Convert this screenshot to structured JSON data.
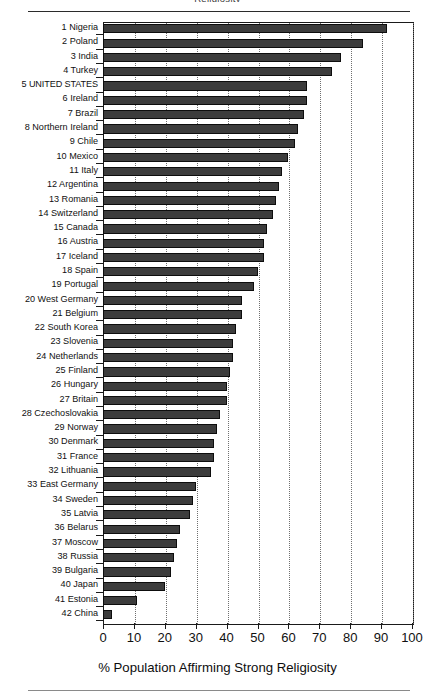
{
  "page": {
    "header_clipped_text": "Religiosity",
    "has_top_rule": true,
    "has_bottom_rule": true
  },
  "chart_data": {
    "type": "bar",
    "orientation": "horizontal",
    "title": "",
    "xlabel": "% Population Affirming Strong Religiosity",
    "ylabel": "",
    "xlim": [
      0,
      100
    ],
    "ylim": null,
    "grid": "vertical-dotted",
    "legend": "none",
    "xticks": [
      0,
      10,
      20,
      30,
      40,
      50,
      60,
      70,
      80,
      90,
      100
    ],
    "xticklabels": [
      "0",
      "10",
      "20",
      "30",
      "40",
      "50",
      "60",
      "70",
      "80",
      "90",
      "100"
    ],
    "bar_color": "#3c3c3c",
    "categories": [
      "1 Nigeria",
      "2 Poland",
      "3 India",
      "4 Turkey",
      "5 UNITED STATES",
      "6 Ireland",
      "7 Brazil",
      "8 Northern Ireland",
      "9 Chile",
      "10 Mexico",
      "11 Italy",
      "12 Argentina",
      "13 Romania",
      "14 Switzerland",
      "15 Canada",
      "16 Austria",
      "17 Iceland",
      "18 Spain",
      "19 Portugal",
      "20 West Germany",
      "21 Belgium",
      "22 South Korea",
      "23 Slovenia",
      "24 Netherlands",
      "25 Finland",
      "26 Hungary",
      "27 Britain",
      "28 Czechoslovakia",
      "29 Norway",
      "30 Denmark",
      "31 France",
      "32 Lithuania",
      "33 East Germany",
      "34 Sweden",
      "35 Latvia",
      "36 Belarus",
      "37 Moscow",
      "38 Russia",
      "39 Bulgaria",
      "40 Japan",
      "41 Estonia",
      "42 China"
    ],
    "values": [
      92,
      84,
      77,
      74,
      66,
      66,
      65,
      63,
      62,
      60,
      58,
      57,
      56,
      55,
      53,
      52,
      52,
      50,
      49,
      45,
      45,
      43,
      42,
      42,
      41,
      40,
      40,
      38,
      37,
      36,
      36,
      35,
      30,
      29,
      28,
      25,
      24,
      23,
      22,
      20,
      11,
      3
    ]
  }
}
